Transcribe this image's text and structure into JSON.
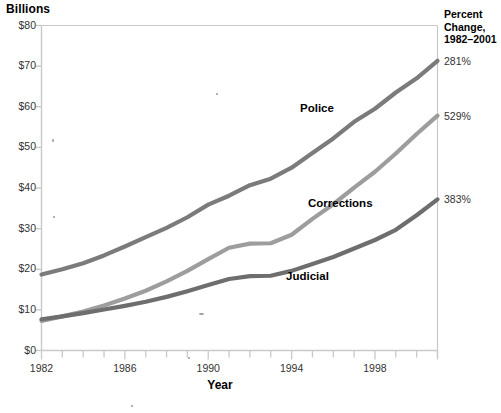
{
  "chart_data": {
    "type": "line",
    "title": "",
    "ylabel": "Billions",
    "xlabel": "Year",
    "ylim": [
      0,
      80
    ],
    "ytick_values": [
      0,
      10,
      20,
      30,
      40,
      50,
      60,
      70,
      80
    ],
    "ytick_labels": [
      "$0",
      "$10",
      "$20",
      "$30",
      "$40",
      "$50",
      "$60",
      "$70",
      "$80"
    ],
    "xlim": [
      1982,
      2001
    ],
    "xtick_labels": [
      "1982",
      "1986",
      "1990",
      "1994",
      "1998"
    ],
    "xtick_label_values": [
      1982,
      1986,
      1990,
      1994,
      1998
    ],
    "x": [
      1982,
      1983,
      1984,
      1985,
      1986,
      1987,
      1988,
      1989,
      1990,
      1991,
      1992,
      1993,
      1994,
      1995,
      1996,
      1997,
      1998,
      1999,
      2000,
      2001
    ],
    "grid": false,
    "legend_position": "inline-labels",
    "series": [
      {
        "name": "Police",
        "color": "#7b7b7b",
        "percent_change": "281%",
        "values": [
          18.7,
          20.0,
          21.5,
          23.4,
          25.6,
          27.9,
          30.2,
          32.8,
          35.9,
          38.1,
          40.7,
          42.3,
          45.0,
          48.6,
          52.2,
          56.3,
          59.5,
          63.5,
          67.0,
          71.3
        ]
      },
      {
        "name": "Corrections",
        "color": "#9d9d9d",
        "percent_change": "529%",
        "values": [
          7.3,
          8.4,
          9.6,
          11.1,
          12.8,
          14.7,
          17.0,
          19.6,
          22.5,
          25.3,
          26.3,
          26.4,
          28.5,
          32.4,
          36.0,
          40.1,
          44.0,
          48.5,
          53.3,
          57.8
        ]
      },
      {
        "name": "Judicial",
        "color": "#6e6e6e",
        "percent_change": "383%",
        "values": [
          7.7,
          8.4,
          9.2,
          10.1,
          11.0,
          12.0,
          13.2,
          14.6,
          16.1,
          17.6,
          18.3,
          18.4,
          19.6,
          21.3,
          23.0,
          25.1,
          27.2,
          29.7,
          33.3,
          37.2
        ]
      }
    ]
  },
  "right_header": {
    "line1": "Percent",
    "line2": "Change,",
    "line3": "1982–2001"
  },
  "colors": {
    "axis": "#c9c9c9",
    "tick_text": "#333333",
    "police": "#7b7b7b",
    "corrections": "#9d9d9d",
    "judicial": "#6e6e6e"
  }
}
